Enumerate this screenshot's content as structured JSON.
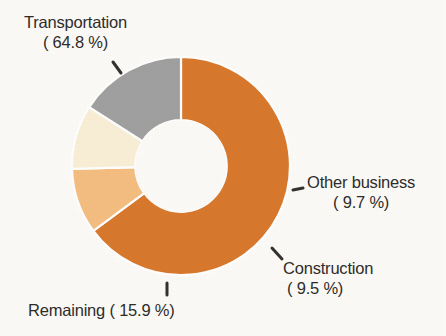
{
  "chart_data": {
    "type": "pie",
    "title": "",
    "subtitle": "",
    "xlabel": "",
    "ylabel": "",
    "donut": true,
    "hole_ratio": 0.42,
    "start_angle_deg": 0,
    "direction": "clockwise",
    "legend_position": "callout-labels",
    "grid": false,
    "unit": "%",
    "categories": [
      "Transportation",
      "Other business",
      "Construction",
      "Remaining"
    ],
    "values": [
      64.8,
      9.7,
      9.5,
      15.9
    ],
    "colors": [
      "#d9782b",
      "#f5be80",
      "#faefd6",
      "#a0a0a0"
    ],
    "slices": [
      {
        "name": "Transportation",
        "value": 64.8,
        "color": "#d9782b",
        "label_name": "Transportation",
        "label_pct": "( 64.8 %)"
      },
      {
        "name": "Other business",
        "value": 9.7,
        "color": "#f5be80",
        "label_name": "Other business",
        "label_pct": "(  9.7 %)"
      },
      {
        "name": "Construction",
        "value": 9.5,
        "color": "#faefd6",
        "label_name": "Construction",
        "label_pct": "(  9.5 %)"
      },
      {
        "name": "Remaining",
        "value": 15.9,
        "color": "#a0a0a0",
        "label_name": "Remaining ( 15.9 %)",
        "label_pct": ""
      }
    ]
  },
  "labels": {
    "transportation": {
      "name": "Transportation",
      "pct": "( 64.8 %)"
    },
    "other_business": {
      "name": "Other business",
      "pct": "(  9.7 %)"
    },
    "construction": {
      "name": "Construction",
      "pct": "(  9.5 %)"
    },
    "remaining": {
      "name": "Remaining ( 15.9 %)"
    }
  },
  "style": {
    "background": "#fdfbf7",
    "text_color": "#2e2c2b",
    "leader_color": "#33312f",
    "slice_gap_color": "#ffffff"
  }
}
